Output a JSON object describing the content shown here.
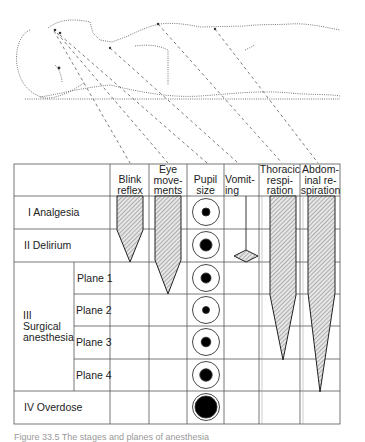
{
  "figure": {
    "illustration": "supine-patient-drawing",
    "columns": [
      {
        "id": "blink",
        "label_lines": [
          "Blink",
          "reflex"
        ]
      },
      {
        "id": "eye",
        "label_lines": [
          "Eye",
          "move-",
          "ments"
        ]
      },
      {
        "id": "pupil",
        "label_lines": [
          "Pupil",
          "size"
        ]
      },
      {
        "id": "vomit",
        "label_lines": [
          "Vomit-",
          "ing"
        ]
      },
      {
        "id": "thoracic",
        "label_lines": [
          "Thoracic",
          "respi-",
          "ration"
        ]
      },
      {
        "id": "abdominal",
        "label_lines": [
          "Abdom-",
          "inal re-",
          "spiration"
        ]
      }
    ],
    "rows": [
      {
        "stage": "I Analgesia"
      },
      {
        "stage": "II Delirium"
      },
      {
        "stage": "III Surgical anesthesia",
        "stage_lines": [
          "III",
          "Surgical",
          "anesthesia"
        ],
        "planes": [
          "Plane 1",
          "Plane 2",
          "Plane 3",
          "Plane 4"
        ]
      },
      {
        "stage": "IV Overdose"
      }
    ],
    "pupil_sizes": [
      {
        "row": "I Analgesia",
        "relative": "small"
      },
      {
        "row": "II Delirium",
        "relative": "large"
      },
      {
        "row": "Plane 1",
        "relative": "medium"
      },
      {
        "row": "Plane 2",
        "relative": "small"
      },
      {
        "row": "Plane 3",
        "relative": "medium"
      },
      {
        "row": "Plane 4",
        "relative": "large"
      },
      {
        "row": "IV Overdose",
        "relative": "fully dilated"
      }
    ],
    "bars": {
      "blink": "present through stage I, tapering to absent at end of stage II",
      "eye": "present through stage II, tapering to absent at end of plane 1",
      "vomit": "line through stage I, diamond at end of stage II",
      "thoracic": "full through plane 2, tapering to absent at end of plane 3",
      "abdominal": "full through plane 2, tapering to absent at end of plane 4"
    },
    "caption": "Figure 33.5  The stages and planes of anesthesia"
  }
}
